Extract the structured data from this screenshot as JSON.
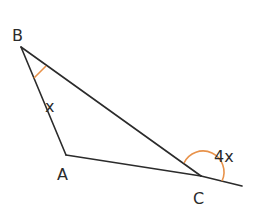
{
  "diagram": {
    "type": "triangle-exterior-angle",
    "vertices": [
      {
        "name": "B",
        "x": 21,
        "y": 47,
        "label_x": 12,
        "label_y": 41
      },
      {
        "name": "A",
        "x": 66,
        "y": 155,
        "label_x": 57,
        "label_y": 180
      },
      {
        "name": "C",
        "x": 201,
        "y": 176,
        "label_x": 193,
        "label_y": 204
      }
    ],
    "extension_end": {
      "x": 242,
      "y": 186
    },
    "angles": [
      {
        "at": "B",
        "label": "x",
        "label_x": 45,
        "label_y": 112
      },
      {
        "at": "C",
        "label": "4x",
        "label_x": 214,
        "label_y": 162,
        "type": "exterior"
      }
    ],
    "colors": {
      "line": "#2b2b2b",
      "arc": "#e8924a"
    }
  }
}
